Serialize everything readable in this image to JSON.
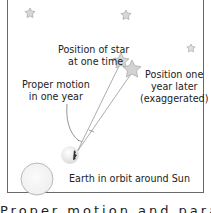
{
  "diagram": {
    "labels": {
      "star_position_now": [
        "Position of star",
        "at one time"
      ],
      "star_position_later": [
        "Position one",
        "year later",
        "(exaggerated)"
      ],
      "proper_motion": [
        "Proper motion",
        "in one year"
      ],
      "earth_orbit": "Earth in orbit around Sun"
    },
    "background_stars": 3,
    "caption": "Proper motion and parallax"
  }
}
